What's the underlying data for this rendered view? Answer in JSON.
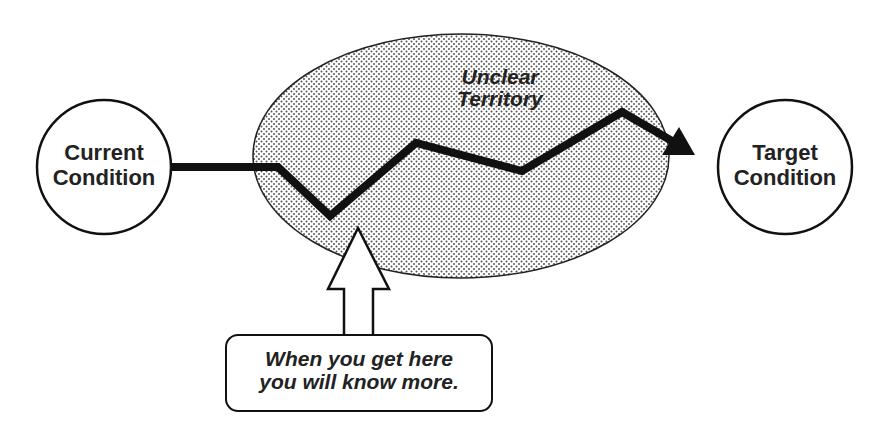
{
  "diagram": {
    "current_condition": {
      "line1": "Current",
      "line2": "Condition"
    },
    "target_condition": {
      "line1": "Target",
      "line2": "Condition"
    },
    "unclear_territory": {
      "line1": "Unclear",
      "line2": "Territory"
    },
    "callout": {
      "line1": "When you get here",
      "line2": "you will know more."
    },
    "colors": {
      "stroke": "#111111",
      "fill_dots": "#555555",
      "background": "#ffffff",
      "text": "#222222"
    }
  }
}
